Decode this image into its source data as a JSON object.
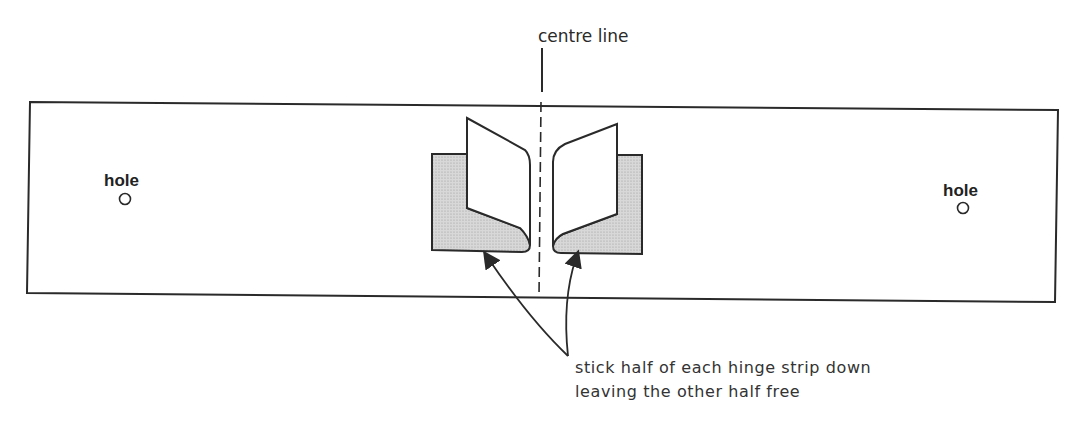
{
  "diagram": {
    "labels": {
      "centre_line": "centre line",
      "hole_left": "hole",
      "hole_right": "hole",
      "instruction_line1": "stick half of each hinge strip down",
      "instruction_line2": "leaving the other half free"
    },
    "colors": {
      "stroke": "#2a2a2a",
      "hinge_fill": "#cfcfcf",
      "background": "#ffffff"
    }
  }
}
